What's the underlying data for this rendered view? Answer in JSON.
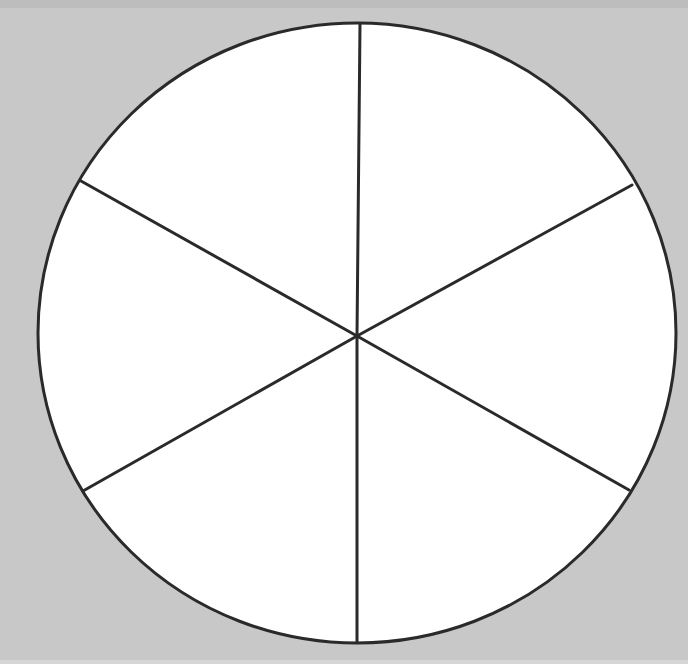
{
  "diagram": {
    "type": "circle-divided-into-equal-segments",
    "segment_count": 6,
    "labels": [],
    "center": [
      357,
      336
    ],
    "radius_x": 319,
    "radius_y": 310,
    "spoke_endpoints": [
      [
        360,
        24
      ],
      [
        632,
        185
      ],
      [
        629,
        490
      ],
      [
        357,
        642
      ],
      [
        83,
        491
      ],
      [
        81,
        181
      ]
    ],
    "colors": {
      "background": "#c8c8c8",
      "fill": "#ffffff",
      "stroke": "#2a2a2a"
    },
    "stroke_width": 3
  }
}
